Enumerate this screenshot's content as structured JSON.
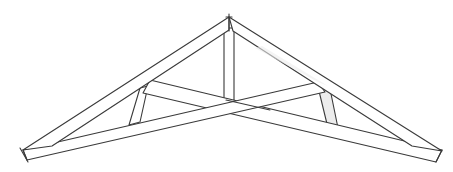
{
  "diagram": {
    "colors": {
      "line": "#3a3a3a",
      "background": "#ffffff",
      "shade": "#ececec"
    },
    "members": [
      {
        "id": "left-top-chord",
        "label": "Left top chord (rafter)"
      },
      {
        "id": "right-top-chord",
        "label": "Right top chord (rafter)"
      },
      {
        "id": "left-scissor-chord",
        "label": "Left scissor bottom chord"
      },
      {
        "id": "right-scissor-chord",
        "label": "Right scissor bottom chord"
      },
      {
        "id": "king-post",
        "label": "Center king post"
      },
      {
        "id": "left-web",
        "label": "Left web strut"
      },
      {
        "id": "right-web",
        "label": "Right web strut"
      }
    ]
  }
}
